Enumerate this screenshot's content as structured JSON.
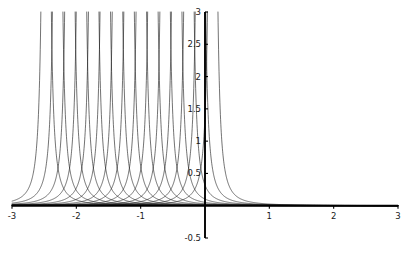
{
  "figure": {
    "name": "asymptotic-curve-family-plot",
    "background_color": "#ffffff",
    "curve_color": "#1c1c1c",
    "axis_color": "#000000",
    "label_color": "#1a1a1a"
  },
  "chart_data": {
    "type": "line",
    "title": "",
    "subtitle": "",
    "xlabel": "",
    "ylabel": "",
    "xlim": [
      -3,
      3
    ],
    "ylim": [
      -0.5,
      3
    ],
    "grid": false,
    "legend": null,
    "legend_position": "none",
    "annotations": [],
    "x_ticks": [
      -3,
      -2,
      -1,
      1,
      2,
      3
    ],
    "x_tick_labels": [
      "-3",
      "-2",
      "-1",
      "1",
      "2",
      "3"
    ],
    "y_ticks": [
      -0.5,
      0.5,
      1,
      1.5,
      2,
      2.5,
      3
    ],
    "y_tick_labels": [
      "-0.5",
      "0.5",
      "1",
      "1.5",
      "2",
      "2.5",
      "3"
    ],
    "x_axis_position_y": 0,
    "y_axis_position_x": 0,
    "series_count": 15,
    "function_form": "y = k / (x - a)^2",
    "function_scale_k": 0.02,
    "asymptotes": [
      -2.47,
      -2.29,
      -2.1,
      -1.92,
      -1.73,
      -1.55,
      -1.36,
      -1.18,
      -0.99,
      -0.81,
      -0.62,
      -0.44,
      -0.25,
      -0.07,
      0.12
    ],
    "series": [
      {
        "name": "curve-1",
        "asymptote": -2.47,
        "values": []
      },
      {
        "name": "curve-2",
        "asymptote": -2.29,
        "values": []
      },
      {
        "name": "curve-3",
        "asymptote": -2.1,
        "values": []
      },
      {
        "name": "curve-4",
        "asymptote": -1.92,
        "values": []
      },
      {
        "name": "curve-5",
        "asymptote": -1.73,
        "values": []
      },
      {
        "name": "curve-6",
        "asymptote": -1.55,
        "values": []
      },
      {
        "name": "curve-7",
        "asymptote": -1.36,
        "values": []
      },
      {
        "name": "curve-8",
        "asymptote": -1.18,
        "values": []
      },
      {
        "name": "curve-9",
        "asymptote": -0.99,
        "values": []
      },
      {
        "name": "curve-10",
        "asymptote": -0.81,
        "values": []
      },
      {
        "name": "curve-11",
        "asymptote": -0.62,
        "values": []
      },
      {
        "name": "curve-12",
        "asymptote": -0.44,
        "values": []
      },
      {
        "name": "curve-13",
        "asymptote": -0.25,
        "values": []
      },
      {
        "name": "curve-14",
        "asymptote": -0.07,
        "values": []
      },
      {
        "name": "curve-15",
        "asymptote": 0.12,
        "values": []
      }
    ]
  },
  "labels": {
    "x": {
      "neg3": "-3",
      "neg2": "-2",
      "neg1": "-1",
      "pos1": "1",
      "pos2": "2",
      "pos3": "3"
    },
    "y": {
      "neg0_5": "-0.5",
      "pos0_5": "0.5",
      "pos1": "1",
      "pos1_5": "1.5",
      "pos2": "2",
      "pos2_5": "2.5",
      "pos3": "3"
    }
  }
}
